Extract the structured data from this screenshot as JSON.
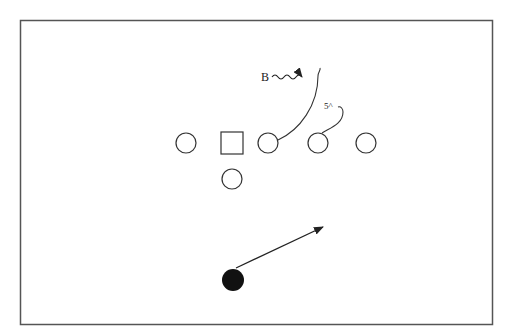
{
  "diagram": {
    "type": "football-play",
    "labels": {
      "motion_label": "B",
      "route_label": "5^"
    },
    "players": [
      {
        "id": "left-tackle",
        "shape": "circle",
        "filled": false
      },
      {
        "id": "center",
        "shape": "square",
        "filled": false
      },
      {
        "id": "right-guard",
        "shape": "circle",
        "filled": false
      },
      {
        "id": "right-tackle",
        "shape": "circle",
        "filled": false
      },
      {
        "id": "tight-end",
        "shape": "circle",
        "filled": false
      },
      {
        "id": "quarterback",
        "shape": "circle",
        "filled": false
      },
      {
        "id": "defender",
        "shape": "circle",
        "filled": true
      }
    ],
    "colors": {
      "stroke": "#333333",
      "fill_solid": "#111111",
      "frame": "#555555",
      "background": "#ffffff"
    }
  }
}
